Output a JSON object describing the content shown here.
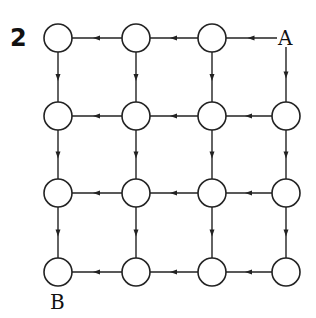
{
  "figure": {
    "number": "2",
    "start_label": "A",
    "end_label": "B"
  },
  "grid": {
    "rows": 4,
    "cols": 4,
    "nodes": [
      {
        "id": "n-0-0",
        "row": 0,
        "col": 0
      },
      {
        "id": "n-0-1",
        "row": 0,
        "col": 1
      },
      {
        "id": "n-0-2",
        "row": 0,
        "col": 2
      },
      {
        "id": "A",
        "row": 0,
        "col": 3,
        "label": "A"
      },
      {
        "id": "n-1-0",
        "row": 1,
        "col": 0
      },
      {
        "id": "n-1-1",
        "row": 1,
        "col": 1
      },
      {
        "id": "n-1-2",
        "row": 1,
        "col": 2
      },
      {
        "id": "n-1-3",
        "row": 1,
        "col": 3
      },
      {
        "id": "n-2-0",
        "row": 2,
        "col": 0
      },
      {
        "id": "n-2-1",
        "row": 2,
        "col": 1
      },
      {
        "id": "n-2-2",
        "row": 2,
        "col": 2
      },
      {
        "id": "n-2-3",
        "row": 2,
        "col": 3
      },
      {
        "id": "n-3-0",
        "row": 3,
        "col": 0,
        "label": "B"
      },
      {
        "id": "n-3-1",
        "row": 3,
        "col": 1
      },
      {
        "id": "n-3-2",
        "row": 3,
        "col": 2
      },
      {
        "id": "n-3-3",
        "row": 3,
        "col": 3
      }
    ],
    "edges_direction": {
      "horizontal": "right-to-left",
      "vertical": "top-to-bottom"
    }
  }
}
